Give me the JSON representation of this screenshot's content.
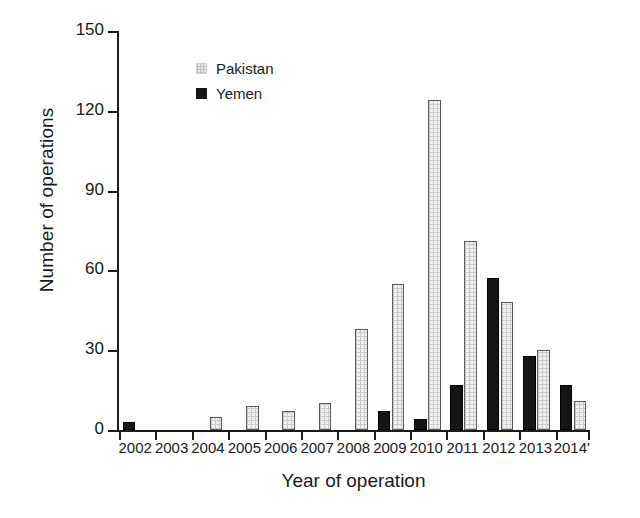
{
  "chart_data": {
    "type": "bar",
    "title": "",
    "subtitle": "",
    "xlabel": "Year of operation",
    "ylabel": "Number of operations",
    "categories": [
      "2002",
      "2003",
      "2004",
      "2005",
      "2006",
      "2007",
      "2008",
      "2009",
      "2010",
      "2011",
      "2012",
      "2013",
      "2014"
    ],
    "series": [
      {
        "name": "Pakistan",
        "color": "#f0f0f0",
        "values": [
          0,
          0,
          5,
          9,
          7,
          10,
          38,
          55,
          124,
          71,
          48,
          30,
          11
        ]
      },
      {
        "name": "Yemen",
        "color": "#151515",
        "values": [
          3,
          0,
          0,
          0,
          0,
          0,
          0,
          7,
          4,
          17,
          57,
          28,
          17
        ]
      }
    ],
    "ylim": [
      0,
      150
    ],
    "yticks": [
      0,
      30,
      60,
      90,
      120,
      150
    ],
    "ytick_labels": [
      "0",
      "30",
      "60",
      "90",
      "120",
      "150"
    ],
    "grid": false,
    "legend_position": "top-left-inside",
    "legend_entries": [
      "Pakistan",
      "Yemen"
    ]
  },
  "axis": {
    "x_title": "Year of operation",
    "y_title": "Number of operations"
  },
  "legend": {
    "items": [
      {
        "label": "Pakistan",
        "swatch": "hatched-light-square"
      },
      {
        "label": "Yemen",
        "swatch": "solid-black-square"
      }
    ]
  }
}
